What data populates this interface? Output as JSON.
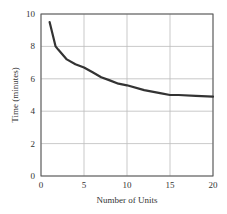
{
  "chart_data": {
    "type": "line",
    "title": "",
    "xlabel": "Number of Units",
    "ylabel": "Time (minutes)",
    "xlim": [
      0,
      20
    ],
    "ylim": [
      0,
      10
    ],
    "xticks": [
      0,
      5,
      10,
      15,
      20
    ],
    "yticks": [
      0,
      2,
      4,
      6,
      8,
      10
    ],
    "grid": true,
    "legend": null,
    "series": [
      {
        "name": "Time per unit",
        "x": [
          1,
          1.7,
          2,
          3,
          4,
          5,
          6,
          7,
          8,
          9,
          10,
          12,
          14,
          15,
          16,
          18,
          20
        ],
        "y": [
          9.5,
          8.0,
          7.8,
          7.2,
          6.9,
          6.7,
          6.4,
          6.1,
          5.9,
          5.7,
          5.6,
          5.3,
          5.1,
          5.0,
          5.0,
          4.95,
          4.9
        ]
      }
    ]
  },
  "axes": {
    "x_label": "Number of Units",
    "y_label": "Time (minutes)",
    "x_tick_labels": [
      "0",
      "5",
      "10",
      "15",
      "20"
    ],
    "y_tick_labels": [
      "0",
      "2",
      "4",
      "6",
      "8",
      "10"
    ]
  },
  "colors": {
    "curve": "#333333",
    "grid": "#bbbbbb",
    "axis": "#555555"
  }
}
